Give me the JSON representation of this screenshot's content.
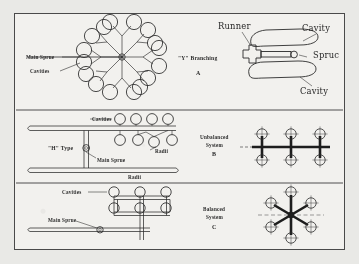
{
  "figure": {
    "background_color": "#e9e9e6",
    "paper_color": "#f2f1ee",
    "ink_color": "#2b2b2b",
    "border_color": "#4a4a4a"
  },
  "panels": [
    {
      "id": "A",
      "letter": "A",
      "caption": "\"Y\"  Branching",
      "labels": [
        {
          "text": "Main Sprue"
        },
        {
          "text": "Cavities"
        }
      ],
      "cavity_count": 16
    },
    {
      "id": "H",
      "letter": "",
      "caption": "\"H\" Type",
      "labels": [
        {
          "text": "Cavities"
        },
        {
          "text": "Main Sprue"
        },
        {
          "text": "Radii"
        },
        {
          "text": "Radii"
        }
      ],
      "cavity_count": 8
    },
    {
      "id": "bottom-left",
      "letter": "",
      "caption": "",
      "labels": [
        {
          "text": "Cavities"
        },
        {
          "text": "Main Sprue"
        }
      ],
      "cavity_count": 6
    },
    {
      "id": "B-detail",
      "letter": "",
      "caption": "",
      "labels": [
        {
          "text": "Runner"
        },
        {
          "text": "Cavity"
        },
        {
          "text": "Spruc"
        },
        {
          "text": "Cavity"
        }
      ],
      "cavity_count": 2
    },
    {
      "id": "B",
      "letter": "B",
      "caption": "Unbalanced\nSystem",
      "caption_line1": "Unbalanced",
      "caption_line2": "System",
      "labels": [],
      "cavity_count": 6
    },
    {
      "id": "C",
      "letter": "C",
      "caption": "Balanced\nSystem",
      "caption_line1": "Balanced",
      "caption_line2": "System",
      "labels": [],
      "cavity_count": 6
    }
  ],
  "text": {
    "main_sprue_1": "Main Sprue",
    "cavities_1": "Cavities",
    "y_branching": "\"Y\"  Branching",
    "letter_a": "A",
    "runner": "Runner",
    "cavity_top": "Cavity",
    "sprue_right": "Spruc",
    "cavity_bottom": "Cavity",
    "cavities_2": "Cavities",
    "radii_1": "Radii",
    "h_type": "\"H\" Type",
    "main_sprue_2": "Main Sprue",
    "radii_2": "Radii",
    "unbalanced_1": "Unbalanced",
    "unbalanced_2": "System",
    "letter_b": "B",
    "cavities_3": "Cavities",
    "main_sprue_3": "Main Sprue",
    "balanced_1": "Balanced",
    "balanced_2": "System",
    "letter_c": "C"
  }
}
